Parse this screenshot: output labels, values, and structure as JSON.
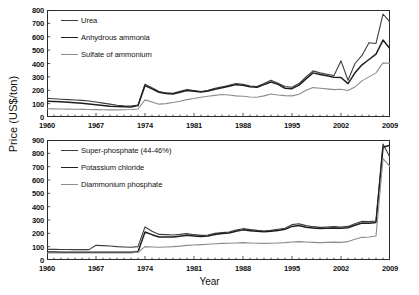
{
  "axis": {
    "ylabel": "Price (US$/ton)",
    "xlabel": "Year"
  },
  "chart_data": [
    {
      "id": "nitrogen",
      "type": "line",
      "title": "",
      "xlabel": "Year",
      "ylabel": "Price (US$/ton)",
      "xlim": [
        1960,
        2009
      ],
      "ylim": [
        0,
        800
      ],
      "yticks": [
        0,
        100,
        200,
        300,
        400,
        500,
        600,
        700,
        800
      ],
      "xticks": [
        1960,
        1967,
        1974,
        1981,
        1988,
        1995,
        2002,
        2009
      ],
      "grid": false,
      "legend_position": "top-left",
      "x": [
        1960,
        1961,
        1962,
        1963,
        1964,
        1965,
        1966,
        1967,
        1968,
        1969,
        1970,
        1971,
        1972,
        1973,
        1974,
        1975,
        1976,
        1977,
        1978,
        1979,
        1980,
        1981,
        1982,
        1983,
        1984,
        1985,
        1986,
        1987,
        1988,
        1989,
        1990,
        1991,
        1992,
        1993,
        1994,
        1995,
        1996,
        1997,
        1998,
        1999,
        2000,
        2001,
        2002,
        2003,
        2004,
        2005,
        2006,
        2007,
        2008,
        2009
      ],
      "series": [
        {
          "name": "Urea",
          "color": "#3d3d3d",
          "values": [
            140,
            137,
            133,
            130,
            127,
            124,
            120,
            112,
            104,
            96,
            88,
            84,
            82,
            90,
            245,
            218,
            190,
            180,
            178,
            192,
            205,
            198,
            190,
            200,
            215,
            225,
            238,
            250,
            245,
            232,
            228,
            250,
            275,
            252,
            240,
            232,
            215,
            195,
            205,
            215,
            225,
            228,
            222,
            250,
            300,
            345,
            330,
            320,
            310,
            325
          ]
        },
        {
          "name": "Anhydrous ammonia",
          "color": "#1f1f1f",
          "values": [
            118,
            116,
            114,
            110,
            106,
            102,
            98,
            92,
            86,
            80,
            78,
            76,
            75,
            85,
            235,
            210,
            185,
            176,
            172,
            185,
            198,
            192,
            186,
            195,
            208,
            218,
            230,
            242,
            238,
            226,
            222,
            242,
            262,
            244,
            232,
            225,
            208,
            190,
            198,
            208,
            215,
            218,
            212,
            238,
            285,
            330,
            318,
            308,
            298,
            312
          ]
        },
        {
          "name": "Sulfate of ammonium",
          "color": "#8c8c8c",
          "values": [
            62,
            61,
            60,
            59,
            58,
            57,
            56,
            55,
            54,
            53,
            53,
            54,
            56,
            60,
            128,
            112,
            96,
            100,
            108,
            118,
            130,
            138,
            148,
            155,
            162,
            168,
            165,
            158,
            155,
            150,
            148,
            158,
            172,
            165,
            160,
            158,
            150,
            142,
            148,
            155,
            160,
            162,
            158,
            170,
            200,
            220,
            215,
            210,
            205,
            212
          ]
        }
      ],
      "series_tail": {
        "note": "1999-2009 continued sharp rise",
        "Urea": [
          228,
          222,
          250,
          300,
          345,
          330,
          320,
          310,
          420,
          275,
          400,
          460,
          555,
          550,
          770,
          710
        ],
        "Anhydrous ammonia": [
          215,
          212,
          238,
          285,
          330,
          318,
          308,
          298,
          295,
          250,
          330,
          390,
          430,
          470,
          575,
          510
        ],
        "Sulfate of ammonium": [
          160,
          158,
          170,
          200,
          220,
          215,
          210,
          205,
          208,
          198,
          225,
          270,
          300,
          330,
          405,
          400
        ]
      }
    },
    {
      "id": "phosphate-potash",
      "type": "line",
      "title": "",
      "xlabel": "Year",
      "ylabel": "Price (US$/ton)",
      "xlim": [
        1960,
        2009
      ],
      "ylim": [
        0,
        900
      ],
      "yticks": [
        0,
        100,
        200,
        300,
        400,
        500,
        600,
        700,
        800,
        900
      ],
      "xticks": [
        1960,
        1967,
        1974,
        1981,
        1988,
        1995,
        2002,
        2009
      ],
      "grid": false,
      "legend_position": "top-left",
      "x": [
        1960,
        1961,
        1962,
        1963,
        1964,
        1965,
        1966,
        1967,
        1968,
        1969,
        1970,
        1971,
        1972,
        1973,
        1974,
        1975,
        1976,
        1977,
        1978,
        1979,
        1980,
        1981,
        1982,
        1983,
        1984,
        1985,
        1986,
        1987,
        1988,
        1989,
        1990,
        1991,
        1992,
        1993,
        1994,
        1995,
        1996,
        1997,
        1998,
        1999,
        2000,
        2001,
        2002,
        2003,
        2004,
        2005,
        2006,
        2007,
        2008,
        2009
      ],
      "series": [
        {
          "name": "Super-phosphate (44-46%)",
          "color": "#3d3d3d",
          "values": [
            80,
            80,
            79,
            79,
            78,
            78,
            78,
            110,
            108,
            105,
            100,
            98,
            96,
            100,
            248,
            215,
            192,
            190,
            188,
            192,
            198,
            190,
            185,
            188,
            200,
            205,
            210,
            225,
            235,
            228,
            222,
            218,
            222,
            230,
            238,
            265,
            272,
            258,
            250,
            245,
            248,
            250,
            248,
            252,
            272,
            290,
            288,
            292,
            870,
            770
          ]
        },
        {
          "name": "Potassium chloride",
          "color": "#1f1f1f",
          "values": [
            60,
            60,
            59,
            59,
            58,
            58,
            58,
            58,
            58,
            58,
            58,
            58,
            58,
            62,
            210,
            190,
            172,
            172,
            172,
            178,
            185,
            180,
            176,
            180,
            192,
            198,
            202,
            215,
            226,
            220,
            215,
            212,
            215,
            222,
            230,
            252,
            258,
            245,
            240,
            236,
            238,
            240,
            238,
            242,
            260,
            278,
            276,
            282,
            845,
            860
          ]
        },
        {
          "name": "Diammonium phosphate",
          "color": "#8c8c8c",
          "values": [
            52,
            52,
            52,
            52,
            52,
            52,
            52,
            52,
            52,
            52,
            52,
            52,
            52,
            58,
            100,
            98,
            96,
            98,
            100,
            104,
            110,
            112,
            115,
            118,
            122,
            125,
            126,
            128,
            130,
            128,
            126,
            125,
            126,
            128,
            130,
            135,
            138,
            135,
            132,
            130,
            132,
            134,
            132,
            138,
            155,
            170,
            172,
            180,
            760,
            700
          ]
        }
      ]
    }
  ],
  "legends": {
    "top": [
      {
        "label": "Urea",
        "color": "#3d3d3d",
        "width": "1.6px"
      },
      {
        "label": "Anhydrous ammonia",
        "color": "#1f1f1f",
        "width": "1.9px"
      },
      {
        "label": "Sulfate of ammonium",
        "color": "#8c8c8c",
        "width": "1.2px"
      }
    ],
    "bottom": [
      {
        "label": "Super-phosphate (44-46%)",
        "color": "#3d3d3d",
        "width": "1.6px"
      },
      {
        "label": "Potassium chloride",
        "color": "#1f1f1f",
        "width": "1.9px"
      },
      {
        "label": "Diammonium phosphate",
        "color": "#8c8c8c",
        "width": "1.2px"
      }
    ]
  }
}
